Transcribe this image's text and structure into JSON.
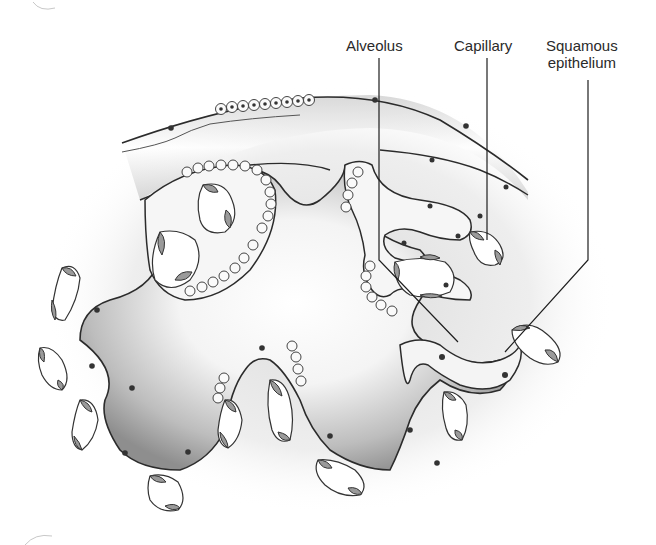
{
  "figure": {
    "labels": [
      {
        "id": "alveolus",
        "text": "Alveolus"
      },
      {
        "id": "capillary",
        "text": "Capillary"
      },
      {
        "id": "squamous_epithelium",
        "line1": "Squamous",
        "line2": "epithelium"
      }
    ]
  },
  "colors": {
    "outline": "#2b2b2b",
    "lumen_shade": "#8d8d8d",
    "tissue_fill": "#f2f2f2",
    "cell_fill": "#9a9a9a",
    "nucleus": "#3a3a3a",
    "leader_line": "#1e1e1e"
  }
}
